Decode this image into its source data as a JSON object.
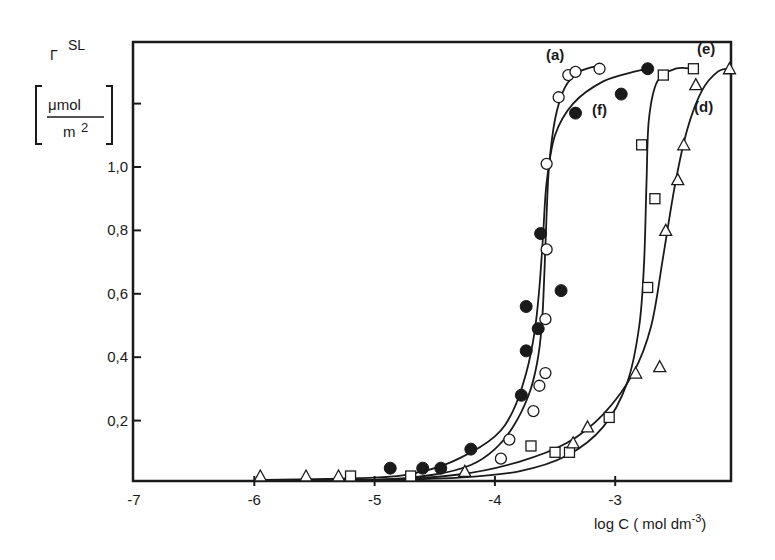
{
  "chart_data": {
    "type": "scatter",
    "title": "",
    "xlabel": "log C ( mol dm-3)",
    "xlabel_main": "log C ( mol dm",
    "xlabel_sup": "-3",
    "xlabel_close": ")",
    "ylabel": "Γ SL [μmol / m2]",
    "ylabel_symbol": "Γ",
    "ylabel_sup": "SL",
    "ylabel_unit_num": "μmol",
    "ylabel_unit_den": "m",
    "ylabel_unit_den_sup": "2",
    "xlim": [
      -7,
      -2.03
    ],
    "ylim": [
      0,
      1.4
    ],
    "xticks": [
      -7,
      -6,
      -5,
      -4,
      -3
    ],
    "xtick_labels": [
      "-7",
      "-6",
      "-5",
      "-4",
      "-3"
    ],
    "yticks": [
      0.2,
      0.4,
      0.6,
      0.8,
      1.0,
      1.2
    ],
    "ytick_labels": [
      "0,2",
      "0,4",
      "0,6",
      "0,8",
      "1,0",
      ""
    ],
    "grid": false,
    "legend_position": "inline labels near curves",
    "series": [
      {
        "name": "(a)",
        "marker": "open-circle",
        "points": [
          [
            -3.95,
            0.08
          ],
          [
            -3.88,
            0.14
          ],
          [
            -3.68,
            0.23
          ],
          [
            -3.63,
            0.31
          ],
          [
            -3.58,
            0.35
          ],
          [
            -3.58,
            0.52
          ],
          [
            -3.57,
            0.74
          ],
          [
            -3.57,
            1.01
          ],
          [
            -3.47,
            1.22
          ],
          [
            -3.39,
            1.29
          ],
          [
            -3.33,
            1.3
          ],
          [
            -3.13,
            1.31
          ]
        ],
        "curve": [
          [
            -6.0,
            0.0
          ],
          [
            -5.0,
            0.01
          ],
          [
            -4.5,
            0.03
          ],
          [
            -4.2,
            0.06
          ],
          [
            -4.0,
            0.11
          ],
          [
            -3.85,
            0.18
          ],
          [
            -3.72,
            0.28
          ],
          [
            -3.65,
            0.38
          ],
          [
            -3.61,
            0.5
          ],
          [
            -3.59,
            0.65
          ],
          [
            -3.57,
            0.85
          ],
          [
            -3.55,
            1.0
          ],
          [
            -3.5,
            1.15
          ],
          [
            -3.42,
            1.25
          ],
          [
            -3.3,
            1.3
          ],
          [
            -3.13,
            1.32
          ]
        ]
      },
      {
        "name": "(f)",
        "marker": "filled-circle",
        "points": [
          [
            -4.87,
            0.05
          ],
          [
            -4.6,
            0.05
          ],
          [
            -4.45,
            0.05
          ],
          [
            -4.2,
            0.11
          ],
          [
            -3.78,
            0.28
          ],
          [
            -3.74,
            0.42
          ],
          [
            -3.74,
            0.56
          ],
          [
            -3.64,
            0.49
          ],
          [
            -3.62,
            0.79
          ],
          [
            -3.45,
            0.61
          ],
          [
            -3.33,
            1.17
          ],
          [
            -2.95,
            1.23
          ],
          [
            -2.73,
            1.31
          ]
        ],
        "curve": [
          [
            -6.0,
            0.0
          ],
          [
            -5.0,
            0.02
          ],
          [
            -4.6,
            0.04
          ],
          [
            -4.3,
            0.08
          ],
          [
            -4.0,
            0.15
          ],
          [
            -3.85,
            0.23
          ],
          [
            -3.74,
            0.35
          ],
          [
            -3.67,
            0.48
          ],
          [
            -3.63,
            0.62
          ],
          [
            -3.6,
            0.78
          ],
          [
            -3.57,
            0.95
          ],
          [
            -3.5,
            1.1
          ],
          [
            -3.35,
            1.2
          ],
          [
            -3.1,
            1.27
          ],
          [
            -2.85,
            1.3
          ],
          [
            -2.73,
            1.31
          ]
        ]
      },
      {
        "name": "(e)",
        "marker": "open-square",
        "points": [
          [
            -5.2,
            0.02
          ],
          [
            -4.7,
            0.02
          ],
          [
            -3.7,
            0.12
          ],
          [
            -3.5,
            0.1
          ],
          [
            -3.38,
            0.1
          ],
          [
            -3.05,
            0.21
          ],
          [
            -2.78,
            1.07
          ],
          [
            -2.73,
            0.62
          ],
          [
            -2.67,
            0.9
          ],
          [
            -2.6,
            1.29
          ],
          [
            -2.35,
            1.31
          ]
        ],
        "curve": [
          [
            -6.0,
            0.0
          ],
          [
            -5.0,
            0.01
          ],
          [
            -4.3,
            0.02
          ],
          [
            -3.8,
            0.04
          ],
          [
            -3.4,
            0.09
          ],
          [
            -3.1,
            0.18
          ],
          [
            -2.9,
            0.32
          ],
          [
            -2.8,
            0.5
          ],
          [
            -2.76,
            0.7
          ],
          [
            -2.74,
            0.95
          ],
          [
            -2.72,
            1.15
          ],
          [
            -2.65,
            1.27
          ],
          [
            -2.5,
            1.31
          ],
          [
            -2.35,
            1.31
          ]
        ]
      },
      {
        "name": "(d)",
        "marker": "open-triangle",
        "points": [
          [
            -5.95,
            0.02
          ],
          [
            -5.57,
            0.02
          ],
          [
            -5.3,
            0.02
          ],
          [
            -4.25,
            0.04
          ],
          [
            -3.35,
            0.13
          ],
          [
            -3.23,
            0.18
          ],
          [
            -2.83,
            0.35
          ],
          [
            -2.63,
            0.37
          ],
          [
            -2.58,
            0.8
          ],
          [
            -2.48,
            0.96
          ],
          [
            -2.43,
            1.07
          ],
          [
            -2.33,
            1.26
          ],
          [
            -2.05,
            1.31
          ]
        ],
        "curve": [
          [
            -6.0,
            0.0
          ],
          [
            -5.0,
            0.01
          ],
          [
            -4.3,
            0.03
          ],
          [
            -3.8,
            0.07
          ],
          [
            -3.4,
            0.13
          ],
          [
            -3.1,
            0.22
          ],
          [
            -2.85,
            0.35
          ],
          [
            -2.7,
            0.5
          ],
          [
            -2.6,
            0.72
          ],
          [
            -2.5,
            0.95
          ],
          [
            -2.4,
            1.12
          ],
          [
            -2.28,
            1.24
          ],
          [
            -2.15,
            1.3
          ],
          [
            -2.05,
            1.31
          ]
        ]
      }
    ]
  },
  "labels": {
    "a": "(a)",
    "f": "(f)",
    "e": "(e)",
    "d": "(d)"
  },
  "colors": {
    "ink": "#1a1a1a",
    "background": "#ffffff"
  }
}
